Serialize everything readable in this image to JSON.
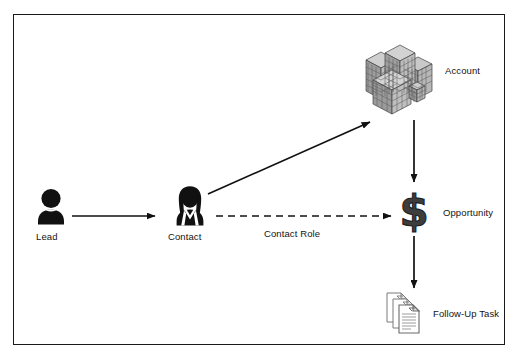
{
  "diagram": {
    "background_color": "#ffffff",
    "border_color": "#1a1a1a",
    "nodes": [
      {
        "id": "lead",
        "label": "Lead",
        "icon": "person-icon",
        "icon_color": "#111111",
        "x": 51,
        "y": 205
      },
      {
        "id": "contact",
        "label": "Contact",
        "icon": "person-female-icon",
        "icon_color": "#111111",
        "x": 188,
        "y": 205
      },
      {
        "id": "account",
        "label": "Account",
        "icon": "buildings-icon",
        "icon_color": "#8c8c8c",
        "x": 390,
        "y": 77
      },
      {
        "id": "opportunity",
        "label": "Opportunity",
        "icon": "dollar-sign-icon",
        "icon_color": "#3a3a3a",
        "x": 414,
        "y": 210
      },
      {
        "id": "followup",
        "label": "Follow-Up Task",
        "icon": "documents-stack-icon",
        "icon_color": "#6e6e6e",
        "x": 402,
        "y": 312
      }
    ],
    "edges": [
      {
        "id": "lead-to-contact",
        "from": "lead",
        "to": "contact",
        "style": "solid",
        "label": "",
        "color": "#111111"
      },
      {
        "id": "contact-to-account",
        "from": "contact",
        "to": "account",
        "style": "solid",
        "label": "",
        "color": "#111111"
      },
      {
        "id": "contact-to-opportunity",
        "from": "contact",
        "to": "opportunity",
        "style": "dashed",
        "label": "Contact Role",
        "color": "#111111"
      },
      {
        "id": "account-to-opportunity",
        "from": "account",
        "to": "opportunity",
        "style": "solid",
        "label": "",
        "color": "#111111"
      },
      {
        "id": "opportunity-to-followup",
        "from": "opportunity",
        "to": "followup",
        "style": "solid",
        "label": "",
        "color": "#111111"
      }
    ]
  }
}
